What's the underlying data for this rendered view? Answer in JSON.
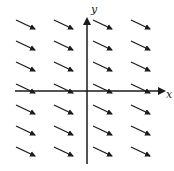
{
  "diagram": {
    "type": "slope-field",
    "axes": {
      "x_label": "x",
      "y_label": "y",
      "color": "#1a1a1a"
    },
    "grid": {
      "columns_x": [
        16,
        54,
        93,
        131
      ],
      "rows_y": [
        20,
        41,
        62,
        84,
        105,
        126,
        147
      ],
      "segment_dx": 19,
      "segment_dy": 9,
      "arrow_color": "#1a1a1a"
    }
  }
}
